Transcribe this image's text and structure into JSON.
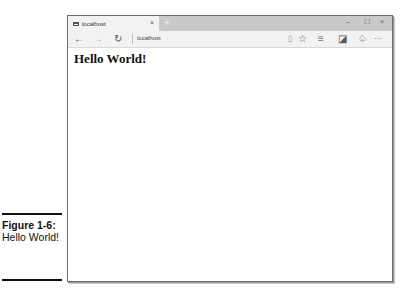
{
  "browser": {
    "tab": {
      "title": "localhost",
      "close_icon": "×"
    },
    "new_tab_icon": "+",
    "window_controls": {
      "minimize": "–",
      "maximize": "☐",
      "close": "×"
    },
    "toolbar": {
      "back_icon": "←",
      "forward_icon": "→",
      "refresh_icon": "↻",
      "address": "localhost",
      "reading_view_icon": "▯",
      "favorite_icon": "☆",
      "hub_icon": "≡",
      "web_note_icon": "◪",
      "share_icon": "♤",
      "more_icon": "···"
    }
  },
  "page": {
    "heading": "Hello World!"
  },
  "caption": {
    "label": "Figure 1-6:",
    "text": "Hello World!"
  }
}
